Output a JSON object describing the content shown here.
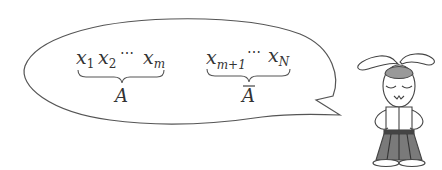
{
  "diagram": {
    "bubble": {
      "stroke": "#555555",
      "fill": "#ffffff"
    },
    "group_a": {
      "terms": [
        {
          "base": "x",
          "sub": "1"
        },
        {
          "base": "x",
          "sub": "2"
        },
        {
          "base": "⋯",
          "sub": ""
        },
        {
          "base": "x",
          "sub": "m"
        }
      ],
      "label": "A"
    },
    "group_a_bar": {
      "terms": [
        {
          "base": "x",
          "sub": "m+1"
        },
        {
          "base": "⋯",
          "sub": ""
        },
        {
          "base": "x",
          "sub": "N"
        }
      ],
      "label": "A",
      "label_decoration": "overline"
    },
    "character": {
      "type": "rabbit",
      "expression": "eyes-closed",
      "head_patch_color": "#999999",
      "skirt_color": "#7a7a7a",
      "belt_color": "#444444"
    }
  }
}
